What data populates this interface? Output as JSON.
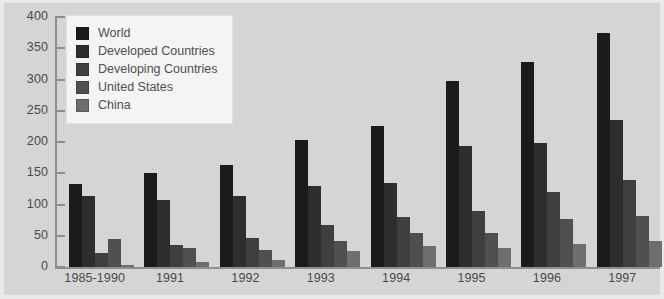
{
  "chart_data": {
    "type": "bar",
    "title": "",
    "subtitle": "",
    "xlabel": "",
    "ylabel": "",
    "ylim": [
      0,
      400
    ],
    "ytick_step": 50,
    "yticks": [
      "0",
      "50",
      "100",
      "150",
      "200",
      "250",
      "300",
      "350",
      "400"
    ],
    "grid": false,
    "legend_position": "top-left",
    "categories": [
      "1985-1990",
      "1991",
      "1992",
      "1993",
      "1994",
      "1995",
      "1996",
      "1997"
    ],
    "series": [
      {
        "name": "World",
        "color": "#1b1b1b",
        "values": [
          133,
          150,
          163,
          204,
          225,
          298,
          328,
          374
        ]
      },
      {
        "name": "Developed Countries",
        "color": "#2e2e2e",
        "values": [
          113,
          108,
          113,
          130,
          134,
          194,
          198,
          235
        ]
      },
      {
        "name": "Developing Countries",
        "color": "#3f3f3f",
        "values": [
          22,
          35,
          47,
          67,
          80,
          90,
          120,
          139
        ]
      },
      {
        "name": "United States",
        "color": "#4f4f4f",
        "values": [
          45,
          30,
          28,
          42,
          55,
          55,
          77,
          82
        ]
      },
      {
        "name": "China",
        "color": "#6e6e6e",
        "values": [
          3,
          8,
          12,
          26,
          34,
          31,
          37,
          42
        ]
      }
    ]
  },
  "style": {
    "page_background": "#e9e9e9",
    "plot_background": "#d5d5d5",
    "axis_color": "#8e8e8e",
    "text_color": "#4a4a4a",
    "legend_background": "#f4f4f4"
  }
}
